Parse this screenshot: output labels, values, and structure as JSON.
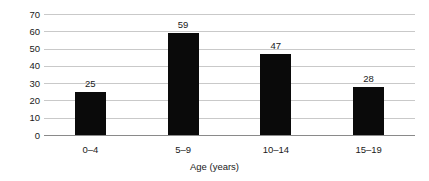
{
  "chart_data": {
    "type": "bar",
    "title": "",
    "subtitle": "",
    "xlabel": "Age (years)",
    "ylabel": "",
    "categories": [
      "0–4",
      "5–9",
      "10–14",
      "15–19"
    ],
    "values": [
      25,
      59,
      47,
      28
    ],
    "data_labels": [
      "25",
      "59",
      "47",
      "28"
    ],
    "ylim": [
      0,
      70
    ],
    "ytick_values": [
      0,
      10,
      20,
      30,
      40,
      50,
      60,
      70
    ],
    "ytick_labels": [
      "0",
      "10",
      "20",
      "30",
      "40",
      "50",
      "60",
      "70"
    ],
    "grid": "horizontal",
    "legend": "none",
    "bar_color": "#0a0a0a",
    "gridline_color": "#c9c9c9",
    "axis_color": "#8a8a8a",
    "background_color": "#ffffff"
  }
}
